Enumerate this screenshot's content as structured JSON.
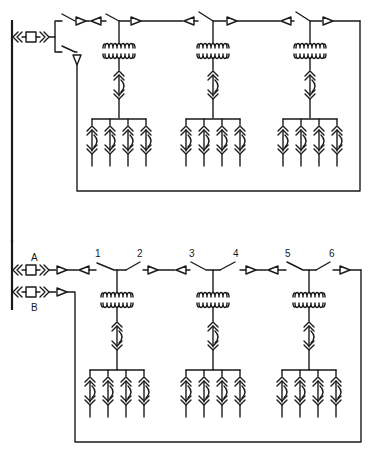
{
  "diagram": {
    "title": "",
    "type": "electrical single-line diagram",
    "colors": {
      "stroke": "#1a1a1a",
      "background": "#ffffff"
    },
    "top_system": {
      "description": "Radial loop with single feeder breaker and three transformer taps",
      "feeder_count": 2,
      "transformers": 3,
      "loads_per_transformer": 4
    },
    "bottom_system": {
      "description": "Primary loop with two feeders A and B, switches 1-6",
      "feeder_labels": [
        "A",
        "B"
      ],
      "switch_labels": [
        "1",
        "2",
        "3",
        "4",
        "5",
        "6"
      ],
      "transformers": 3,
      "loads_per_transformer": 4
    }
  }
}
